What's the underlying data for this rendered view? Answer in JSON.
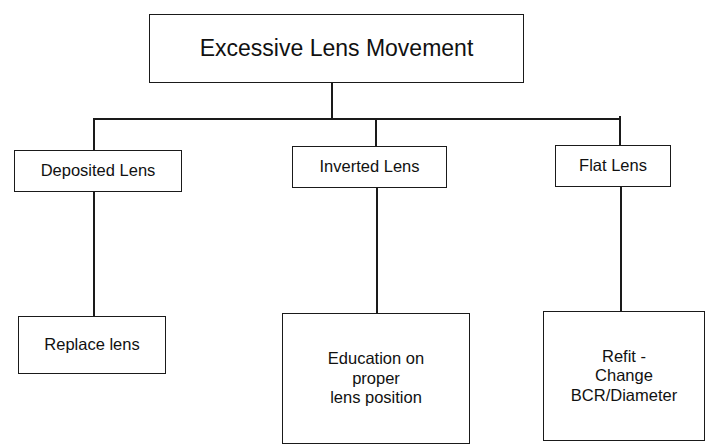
{
  "diagram": {
    "type": "tree",
    "root": {
      "id": "root",
      "label": "Excessive Lens Movement"
    },
    "causes": [
      {
        "id": "deposited",
        "label": "Deposited Lens",
        "remedy": {
          "id": "replace",
          "label": "Replace lens"
        }
      },
      {
        "id": "inverted",
        "label": "Inverted Lens",
        "remedy": {
          "id": "education",
          "label": "Education on\nproper\nlens position"
        }
      },
      {
        "id": "flat",
        "label": "Flat Lens",
        "remedy": {
          "id": "refit",
          "label": "Refit  -\nChange\nBCR/Diameter"
        }
      }
    ],
    "colors": {
      "line": "#1a1a1a",
      "background": "#ffffff",
      "text": "#111111"
    }
  }
}
